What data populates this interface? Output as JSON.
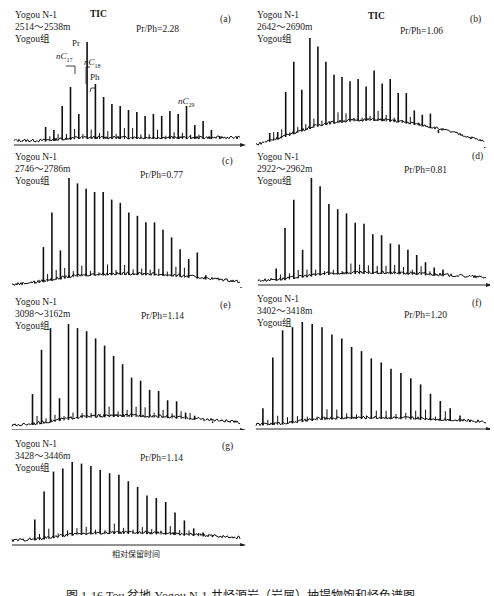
{
  "figure": {
    "caption": "图 1-16 Tou 盆地 Yogou N-1 井烃源岩（岩屑）抽提物饱和烃色谱图",
    "x_axis_label": "相对保留时间",
    "tic_label": "TIC"
  },
  "panels": [
    {
      "id": "a",
      "tag": "(a)",
      "well": "Yogou N-1",
      "depth": "2514～2538m",
      "formation": "Yogou组",
      "ratio": "Pr/Ph=2.28",
      "tic": true,
      "annotations": {
        "nC17": "nC",
        "nC17_sub": "17",
        "pr": "Pr",
        "nC18": "nC",
        "nC18_sub": "18",
        "ph": "Ph",
        "nC29": "nC",
        "nC29_sub": "29"
      }
    },
    {
      "id": "b",
      "tag": "(b)",
      "well": "Yogou N-1",
      "depth": "2642～2690m",
      "formation": "Yogou组",
      "ratio": "Pr/Ph=1.06",
      "tic": true
    },
    {
      "id": "c",
      "tag": "(c)",
      "well": "Yogou N-1",
      "depth": "2746～2786m",
      "formation": "Yogou组",
      "ratio": "Pr/Ph=0.77"
    },
    {
      "id": "d",
      "tag": "(d)",
      "well": "Yogou N-1",
      "depth": "2922～2962m",
      "formation": "Yogou组",
      "ratio": "Pr/Ph=0.81"
    },
    {
      "id": "e",
      "tag": "(e)",
      "well": "Yogou N-1",
      "depth": "3098～3162m",
      "formation": "Yogou组",
      "ratio": "Pr/Ph=1.14"
    },
    {
      "id": "f",
      "tag": "(f)",
      "well": "Yogou N-1",
      "depth": "3402～3418m",
      "formation": "Yogou组",
      "ratio": "Pr/Ph=1.20"
    },
    {
      "id": "g",
      "tag": "(g)",
      "well": "Yogou N-1",
      "depth": "3428～3446m",
      "formation": "Yogou组",
      "ratio": "Pr/Ph=1.14"
    }
  ],
  "chart_data": [
    {
      "type": "bar",
      "title": "(a) Yogou N-1 2514～2538m Yogou组",
      "xlabel": "相对保留时间",
      "ylabel": "",
      "ratio": "Pr/Ph=2.28",
      "peak_heights_rel": [
        0.15,
        0.12,
        0.36,
        0.55,
        0.28,
        1.0,
        0.58,
        0.45,
        0.38,
        0.36,
        0.32,
        0.3,
        0.26,
        0.28,
        0.26,
        0.31,
        0.28,
        0.36,
        0.17,
        0.21,
        0.12,
        0.06
      ]
    },
    {
      "type": "bar",
      "title": "(b) Yogou N-1 2642～2690m Yogou组",
      "xlabel": "相对保留时间",
      "ratio": "Pr/Ph=1.06",
      "peak_heights_rel": [
        0.12,
        0.13,
        0.5,
        0.78,
        0.52,
        1.0,
        0.92,
        0.78,
        0.66,
        0.64,
        0.6,
        0.62,
        0.55,
        0.7,
        0.58,
        0.62,
        0.49,
        0.49,
        0.33,
        0.29,
        0.3,
        0.12
      ]
    },
    {
      "type": "bar",
      "title": "(c) Yogou N-1 2746～2786m Yogou组",
      "xlabel": "相对保留时间",
      "ratio": "Pr/Ph=0.77",
      "peak_heights_rel": [
        0.04,
        0.36,
        0.68,
        0.33,
        1.0,
        0.95,
        0.9,
        0.87,
        0.87,
        0.8,
        0.77,
        0.68,
        0.65,
        0.59,
        0.59,
        0.52,
        0.45,
        0.34,
        0.25,
        0.31,
        0.1
      ]
    },
    {
      "type": "bar",
      "title": "(d) Yogou N-1 2922～2962m Yogou组",
      "xlabel": "相对保留时间",
      "ratio": "Pr/Ph=0.81",
      "peak_heights_rel": [
        0.13,
        0.52,
        0.79,
        0.31,
        1.0,
        0.92,
        0.75,
        0.7,
        0.66,
        0.57,
        0.56,
        0.46,
        0.45,
        0.37,
        0.36,
        0.31,
        0.26,
        0.19,
        0.14,
        0.12,
        0.05
      ]
    },
    {
      "type": "bar",
      "title": "(e) Yogou N-1 3098～3162m Yogou组",
      "xlabel": "相对保留时间",
      "ratio": "Pr/Ph=1.14",
      "peak_heights_rel": [
        0.32,
        0.75,
        0.96,
        0.28,
        1.0,
        0.96,
        0.93,
        0.86,
        0.79,
        0.69,
        0.61,
        0.48,
        0.45,
        0.36,
        0.35,
        0.26,
        0.25,
        0.14,
        0.11,
        0.07,
        0.04
      ]
    },
    {
      "type": "bar",
      "title": "(f) Yogou N-1 3402～3418m Yogou组",
      "xlabel": "相对保留时间",
      "ratio": "Pr/Ph=1.20",
      "peak_heights_rel": [
        0.17,
        0.66,
        0.92,
        0.95,
        1.0,
        0.98,
        0.95,
        0.88,
        0.84,
        0.76,
        0.72,
        0.65,
        0.61,
        0.55,
        0.51,
        0.46,
        0.4,
        0.31,
        0.24,
        0.17,
        0.1,
        0.06
      ]
    },
    {
      "type": "bar",
      "title": "(g) Yogou N-1 3428～3446m Yogou组",
      "xlabel": "相对保留时间",
      "ratio": "Pr/Ph=1.14",
      "peak_heights_rel": [
        0.28,
        0.63,
        0.88,
        0.92,
        1.0,
        0.98,
        0.95,
        0.9,
        0.86,
        0.84,
        0.76,
        0.69,
        0.58,
        0.55,
        0.5,
        0.37,
        0.27,
        0.17,
        0.12,
        0.08,
        0.05
      ]
    }
  ]
}
